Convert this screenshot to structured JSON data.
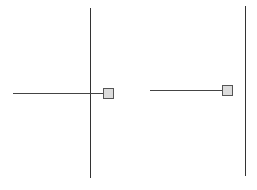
{
  "diagram": {
    "background": "#ffffff",
    "line_color": "#333333",
    "handle_fill": "#dcdcdc",
    "handle_border": "#555555",
    "panels": [
      {
        "name": "left",
        "vertical_line": {
          "x": 90,
          "y1": 8,
          "y2": 178
        },
        "horizontal_line": {
          "x1": 13,
          "x2": 103,
          "y": 93
        },
        "handle": {
          "x": 103,
          "y": 88,
          "size": 9
        }
      },
      {
        "name": "right",
        "vertical_line": {
          "x": 245,
          "y1": 6,
          "y2": 176
        },
        "horizontal_line": {
          "x1": 150,
          "x2": 222,
          "y": 90
        },
        "handle": {
          "x": 222,
          "y": 85,
          "size": 9
        }
      }
    ]
  }
}
